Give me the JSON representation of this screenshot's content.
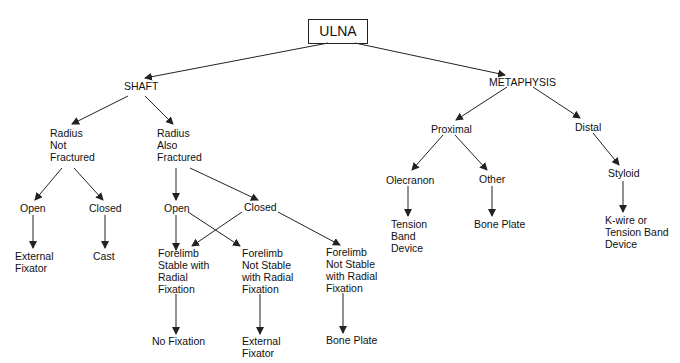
{
  "title": "ULNA",
  "nodes": {
    "root": "ULNA",
    "shaft": "SHAFT",
    "metaphysis": "METAPHYSIS",
    "radius_not_fractured": "Radius\nNot\nFractured",
    "radius_also_fractured": "Radius\nAlso\nFractured",
    "rnf_open": "Open",
    "rnf_closed": "Closed",
    "rnf_open_tx": "External\nFixator",
    "rnf_closed_tx": "Cast",
    "raf_open": "Open",
    "raf_closed": "Closed",
    "forelimb_stable": "Forelimb\nStable with\nRadial\nFixation",
    "forelimb_not_stable_1": "Forelimb\nNot Stable\nwith Radial\nFixation",
    "forelimb_not_stable_2": "Forelimb\nNot Stable\nwith Radial\nFixation",
    "no_fixation": "No Fixation",
    "external_fixator": "External\nFixator",
    "bone_plate_shaft": "Bone Plate",
    "proximal": "Proximal",
    "distal": "Distal",
    "olecranon": "Olecranon",
    "other": "Other",
    "styloid": "Styloid",
    "tension_band": "Tension\nBand\nDevice",
    "bone_plate_meta": "Bone Plate",
    "kwire": "K-wire or\nTension Band\nDevice"
  },
  "colors": {
    "line": "#222222",
    "text": "#111111",
    "background": "#ffffff"
  }
}
